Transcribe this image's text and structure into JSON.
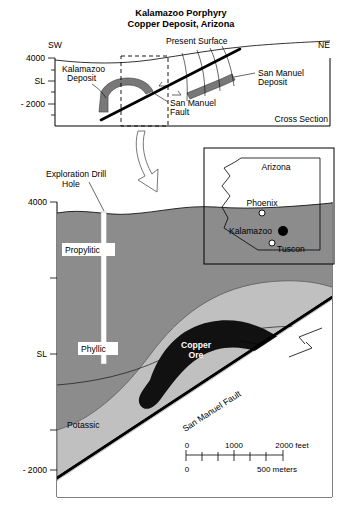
{
  "figure": {
    "title_line1": "Kalamazoo Porphyry",
    "title_line2": "Copper Deposit, Arizona"
  },
  "upper_section": {
    "name": "Cross Section",
    "caption": "Cross Section",
    "direction_left": "SW",
    "direction_right": "NE",
    "axis_labels": [
      "4000",
      "SL",
      "- 2000"
    ],
    "annotations": {
      "present_surface": "Present Surface",
      "kalamazoo_deposit": "Kalamazoo\nDeposit",
      "kalamazoo_deposit_l1": "Kalamazoo",
      "kalamazoo_deposit_l2": "Deposit",
      "san_manuel_deposit_l1": "San Manuel",
      "san_manuel_deposit_l2": "Deposit",
      "san_manuel_fault_l1": "San Manuel",
      "san_manuel_fault_l2": "Fault"
    }
  },
  "lower_section": {
    "axis_labels": [
      "4000",
      "SL",
      "- 2000"
    ],
    "drill_hole_label_l1": "Exploration Drill",
    "drill_hole_label_l2": "Hole",
    "zones": [
      {
        "id": "propylitic",
        "label": "Propylitic",
        "color": "#8c8c8c"
      },
      {
        "id": "phyllic",
        "label": "Phyllic",
        "color": "#c0c0c0"
      },
      {
        "id": "potassic",
        "label": "Potassic",
        "color": "#c0c0c0"
      },
      {
        "id": "copper-ore",
        "label_l1": "Copper",
        "label_l2": "Ore",
        "color": "#111111"
      }
    ],
    "fault_label": "San Manuel Fault",
    "scale_bar": {
      "feet_start": "0",
      "feet_mid": "1000",
      "feet_end": "2000 feet",
      "meters_start": "0",
      "meters_end": "500 meters"
    }
  },
  "inset_map": {
    "state": "Arizona",
    "cities": [
      {
        "name": "Phoenix",
        "marker": "open"
      },
      {
        "name": "Kalamazoo",
        "marker": "filled"
      },
      {
        "name": "Tuscon",
        "marker": "open"
      }
    ]
  },
  "colors": {
    "propylitic": "#8c8c8c",
    "phyllic": "#c0c0c0",
    "potassic": "#c0c0c0",
    "ore": "#111111",
    "deposit_gray": "#787878",
    "outline": "#000000"
  }
}
